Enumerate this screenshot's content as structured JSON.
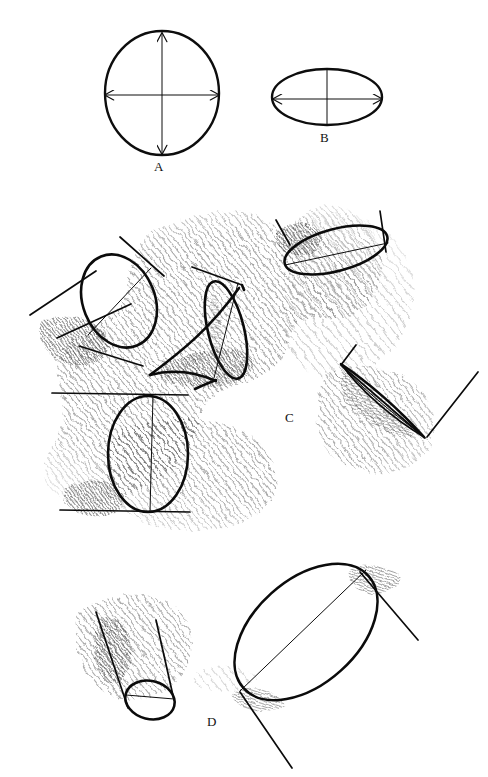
{
  "plate": {
    "title": "Ellipse construction and cylinders in perspective",
    "width": 488,
    "height": 777,
    "background_color": "#ffffff",
    "ink_color": "#0d0d0d",
    "shading_color": "#2b2b2b",
    "medium": "pen-and-ink line drawing with diagonal hatching"
  },
  "figures": [
    {
      "key": "A",
      "label": "A",
      "caption_position": {
        "x": 158,
        "y": 166
      },
      "description": "Perfect circle with horizontal and vertical double-headed diameter arrows of equal length",
      "shape": "circle",
      "center": {
        "x": 162,
        "y": 93
      },
      "radius_x": 57,
      "radius_y": 62,
      "axes": [
        {
          "name": "horizontal-diameter",
          "double_arrow": true,
          "length_px": 114
        },
        {
          "name": "vertical-diameter",
          "double_arrow": true,
          "length_px": 124
        }
      ]
    },
    {
      "key": "B",
      "label": "B",
      "caption_position": {
        "x": 324,
        "y": 137
      },
      "description": "Ellipse (foreshortened circle) with long horizontal major-axis double arrow and a short vertical minor axis line",
      "shape": "ellipse",
      "center": {
        "x": 327,
        "y": 97
      },
      "radius_x": 55,
      "radius_y": 28,
      "axes": [
        {
          "name": "major-axis",
          "double_arrow": true,
          "length_px": 110
        },
        {
          "name": "minor-axis",
          "double_arrow": false,
          "length_px": 56
        }
      ]
    },
    {
      "key": "C",
      "label": "C",
      "caption_position": {
        "x": 289,
        "y": 418
      },
      "description": "Four coin/cylinder studies resting on hatched ground planes at differing tilts: three-quarter disc at upper left, receding cylinder at upper middle, near-circular disc at lower left, and an edge-on sliver disc at right",
      "objects": [
        {
          "name": "tilted-disc-upper-left",
          "type": "disc",
          "view": "three-quarter"
        },
        {
          "name": "receding-cylinder",
          "type": "cylinder",
          "view": "foreshortened"
        },
        {
          "name": "upright-disc-lower-left",
          "type": "disc",
          "view": "near-frontal"
        },
        {
          "name": "edge-on-disc-right",
          "type": "disc",
          "view": "edge-on-sliver"
        },
        {
          "name": "tilted-ellipse-upper-right",
          "type": "disc",
          "view": "shallow-ellipse"
        }
      ]
    },
    {
      "key": "D",
      "label": "D",
      "caption_position": {
        "x": 211,
        "y": 722
      },
      "description": "Two larger studies: a short shaded cylinder tipping away at left and a large open ellipse seen at a steep tilt at right",
      "objects": [
        {
          "name": "shaded-cylinder-left",
          "type": "cylinder",
          "view": "tipped-away"
        },
        {
          "name": "large-tilted-ellipse-right",
          "type": "disc",
          "view": "steep-tilt"
        }
      ]
    }
  ]
}
